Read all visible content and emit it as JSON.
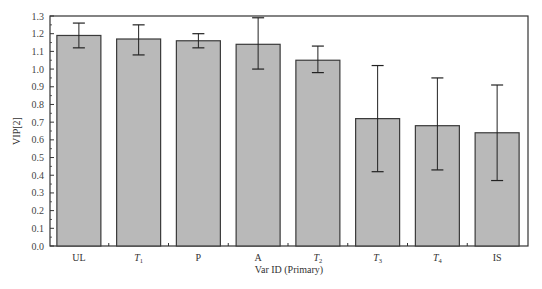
{
  "chart_data": {
    "type": "bar",
    "title": "",
    "xlabel": "Var ID (Primary)",
    "ylabel": "VIP[2]",
    "ylim": [
      0.0,
      1.3
    ],
    "yticks": [
      "0.0",
      "0.1",
      "0.2",
      "0.3",
      "0.4",
      "0.5",
      "0.6",
      "0.7",
      "0.8",
      "0.9",
      "1.0",
      "1.1",
      "1.2",
      "1.3"
    ],
    "grid": false,
    "legend": null,
    "categories": [
      {
        "label": "UL",
        "sub": "",
        "italic": false
      },
      {
        "label": "T",
        "sub": "1",
        "italic": true
      },
      {
        "label": "P",
        "sub": "",
        "italic": false
      },
      {
        "label": "A",
        "sub": "",
        "italic": false
      },
      {
        "label": "T",
        "sub": "2",
        "italic": true
      },
      {
        "label": "T",
        "sub": "3",
        "italic": true
      },
      {
        "label": "T",
        "sub": "4",
        "italic": true
      },
      {
        "label": "IS",
        "sub": "",
        "italic": false
      }
    ],
    "values": [
      1.19,
      1.17,
      1.16,
      1.14,
      1.05,
      0.72,
      0.68,
      0.64
    ],
    "error_low": [
      1.12,
      1.08,
      1.12,
      1.0,
      0.98,
      0.42,
      0.43,
      0.37
    ],
    "error_high": [
      1.26,
      1.25,
      1.2,
      1.29,
      1.13,
      1.02,
      0.95,
      0.91
    ],
    "colors": {
      "bar_fill": "#b9b9b9",
      "bar_stroke": "#3a3a3a",
      "axis": "#333333",
      "error": "#222222"
    }
  },
  "caption": "Figure 3  The VIP values of each variable"
}
